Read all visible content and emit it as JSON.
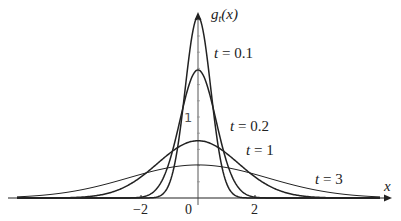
{
  "chart_data": {
    "type": "line",
    "title": "",
    "xlabel": "x",
    "ylabel": "g_t(x)",
    "xlim": [
      -6.6,
      6.8
    ],
    "ylim": [
      0,
      2.4
    ],
    "grid": false,
    "legend": "inline labels next to curves",
    "x_ticks": [
      {
        "value": -2,
        "label": "−2"
      },
      {
        "value": 0,
        "label": "0"
      },
      {
        "value": 2,
        "label": "2"
      }
    ],
    "y_ticks": [
      {
        "value": 1,
        "label": "1"
      }
    ],
    "formula": "g_t(x) = (1/sqrt(2t)) * exp(-x^2/(4t))",
    "series": [
      {
        "name": "t = 0.1",
        "t": 0.1,
        "peak": 2.24
      },
      {
        "name": "t = 0.2",
        "t": 0.2,
        "peak": 1.58
      },
      {
        "name": "t = 1",
        "t": 1,
        "peak": 0.71
      },
      {
        "name": "t = 3",
        "t": 3,
        "peak": 0.41
      }
    ],
    "annotations": [
      {
        "text": "t = 0.1",
        "x": 1.6,
        "y": 1.8
      },
      {
        "text": "t = 0.2",
        "x": 3.2,
        "y": 0.95
      },
      {
        "text": "t = 1",
        "x": 4.6,
        "y": 0.65
      },
      {
        "text": "t = 3",
        "x": 9.0,
        "y": 0.36
      }
    ]
  },
  "labels": {
    "y_axis": "g",
    "y_axis_sub": "t",
    "y_axis_arg": "(x)",
    "x_axis": "x",
    "t01": "t = 0.1",
    "t02": "t = 0.2",
    "t1": "t = 1",
    "t3": "t = 3",
    "xm2": "−2",
    "x0": "0",
    "x2": "2",
    "y1": "1"
  }
}
